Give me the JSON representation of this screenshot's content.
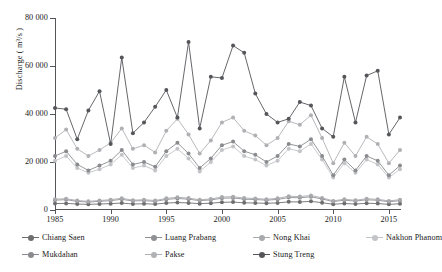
{
  "chart_data": {
    "type": "line",
    "title": "",
    "xlabel": "",
    "ylabel": "Discharge ( m³/s )",
    "xlim": [
      1985,
      2016
    ],
    "ylim": [
      0,
      80000
    ],
    "ytick_labels": [
      "0",
      "20 000",
      "40 000",
      "60 000",
      "80 000"
    ],
    "ytick_values": [
      0,
      20000,
      40000,
      60000,
      80000
    ],
    "xtick_labels": [
      "1985",
      "1990",
      "1995",
      "2000",
      "2005",
      "2010",
      "2015"
    ],
    "xtick_values": [
      1985,
      1990,
      1995,
      2000,
      2005,
      2010,
      2015
    ],
    "grid": false,
    "legend_position": "below",
    "x": [
      1985,
      1986,
      1987,
      1988,
      1989,
      1990,
      1991,
      1992,
      1993,
      1994,
      1995,
      1996,
      1997,
      1998,
      1999,
      2000,
      2001,
      2002,
      2003,
      2004,
      2005,
      2006,
      2007,
      2008,
      2009,
      2010,
      2011,
      2012,
      2013,
      2014,
      2015,
      2016
    ],
    "series": [
      {
        "name": "Chiang Saen",
        "color": "#6e6e70",
        "values": [
          2700,
          2750,
          2500,
          2350,
          2500,
          2650,
          2900,
          2500,
          2600,
          2450,
          2900,
          3100,
          2950,
          2650,
          2850,
          3200,
          3300,
          3000,
          2900,
          2800,
          2950,
          3400,
          3350,
          3600,
          3050,
          2400,
          2700,
          2500,
          2800,
          2700,
          2350,
          2600
        ]
      },
      {
        "name": "Luang Prabang",
        "color": "#8f9093",
        "values": [
          4100,
          4300,
          3600,
          3300,
          3600,
          3900,
          4450,
          3750,
          3900,
          3600,
          4400,
          4800,
          4500,
          3900,
          4200,
          4900,
          5050,
          4500,
          4350,
          4100,
          4400,
          5200,
          5100,
          5500,
          4600,
          3500,
          4100,
          3700,
          4250,
          4050,
          3450,
          3900
        ]
      },
      {
        "name": "Nong Khai",
        "color": "#a9aaad",
        "values": [
          4500,
          4700,
          3950,
          3600,
          3950,
          4300,
          4900,
          4100,
          4300,
          3950,
          4850,
          5300,
          4950,
          4250,
          4600,
          5400,
          5550,
          4950,
          4800,
          4500,
          4850,
          5750,
          5600,
          6050,
          5050,
          3800,
          4500,
          4050,
          4700,
          4450,
          3800,
          4300
        ]
      },
      {
        "name": "Nakhon Phanom",
        "color": "#c3c4c7",
        "values": [
          20500,
          22500,
          17500,
          15500,
          17000,
          19000,
          23000,
          17500,
          18500,
          16500,
          22500,
          25500,
          21500,
          16000,
          20000,
          25000,
          26500,
          22500,
          21000,
          18500,
          20500,
          25500,
          24500,
          27500,
          21000,
          13500,
          19500,
          15500,
          21000,
          19000,
          13500,
          17000
        ]
      },
      {
        "name": "Mukdahan",
        "color": "#8a8b8e",
        "values": [
          22500,
          24500,
          19000,
          16500,
          18500,
          20500,
          25000,
          19000,
          20000,
          18000,
          24500,
          28000,
          23500,
          17500,
          21500,
          27000,
          28500,
          24500,
          23000,
          20000,
          22500,
          27500,
          26500,
          29500,
          22500,
          14500,
          21000,
          16500,
          22500,
          20500,
          14500,
          18500
        ]
      },
      {
        "name": "Pakse",
        "color": "#b0b1b4",
        "values": [
          30000,
          33500,
          25500,
          22500,
          25000,
          28000,
          34000,
          25500,
          27000,
          24000,
          33000,
          38000,
          31500,
          23500,
          29000,
          36500,
          38500,
          33000,
          31000,
          27000,
          30000,
          37000,
          35500,
          39500,
          30000,
          19500,
          28000,
          22500,
          30500,
          27500,
          19500,
          25000
        ]
      },
      {
        "name": "Stung Treng",
        "color": "#55565a",
        "values": [
          42500,
          42000,
          29500,
          41500,
          49500,
          27500,
          63500,
          32000,
          36500,
          43000,
          50000,
          38500,
          70000,
          34000,
          55500,
          55000,
          68500,
          65500,
          48500,
          40000,
          36500,
          38000,
          45000,
          43500,
          34000,
          30500,
          55500,
          36500,
          56000,
          58000,
          31500,
          38500
        ]
      }
    ]
  },
  "legend": {
    "items": [
      {
        "label": "Chiang Saen"
      },
      {
        "label": "Luang Prabang"
      },
      {
        "label": "Nong Khai"
      },
      {
        "label": "Nakhon Phanom"
      },
      {
        "label": "Mukdahan"
      },
      {
        "label": "Pakse"
      },
      {
        "label": "Stung Treng"
      }
    ]
  }
}
